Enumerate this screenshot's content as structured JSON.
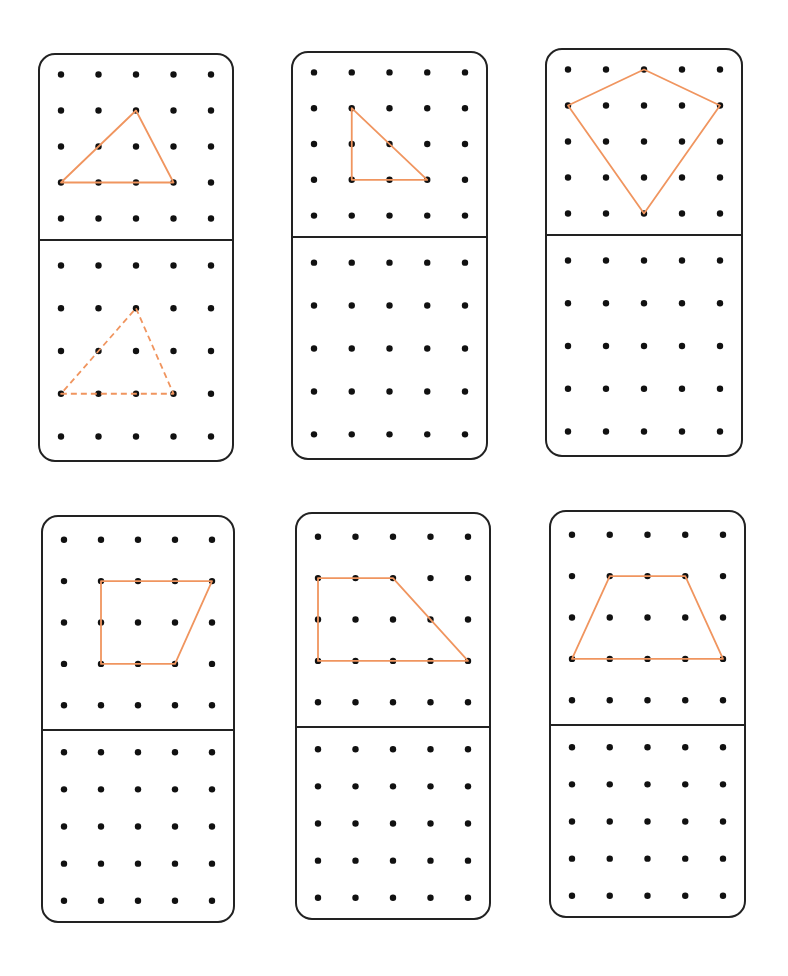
{
  "worksheet": {
    "grid": {
      "rows": 5,
      "cols": 5
    },
    "stroke_color": "#F0955F",
    "dot_color": "#111111",
    "border_color": "#222222",
    "cards": [
      {
        "id": "card-1",
        "box": {
          "x": 38,
          "y": 53,
          "w": 196,
          "h": 409,
          "divider_y": 187
        },
        "top_shape": {
          "type": "triangle",
          "style": "solid",
          "points": [
            [
              2,
              1
            ],
            [
              3,
              3
            ],
            [
              0,
              3
            ]
          ]
        },
        "bottom_shape": {
          "type": "triangle",
          "style": "dashed",
          "points": [
            [
              2,
              1
            ],
            [
              3,
              3
            ],
            [
              0,
              3
            ]
          ]
        }
      },
      {
        "id": "card-2",
        "box": {
          "x": 291,
          "y": 51,
          "w": 197,
          "h": 409,
          "divider_y": 186
        },
        "top_shape": {
          "type": "right-triangle",
          "style": "solid",
          "points": [
            [
              1,
              1
            ],
            [
              3,
              3
            ],
            [
              1,
              3
            ]
          ]
        },
        "bottom_shape": null
      },
      {
        "id": "card-3",
        "box": {
          "x": 545,
          "y": 48,
          "w": 198,
          "h": 409,
          "divider_y": 187
        },
        "top_shape": {
          "type": "kite",
          "style": "solid",
          "points": [
            [
              2,
              0
            ],
            [
              4,
              1
            ],
            [
              2,
              4
            ],
            [
              0,
              1
            ]
          ]
        },
        "bottom_shape": null
      },
      {
        "id": "card-4",
        "box": {
          "x": 41,
          "y": 515,
          "w": 194,
          "h": 408,
          "divider_y": 215
        },
        "top_shape": {
          "type": "right-trapezoid",
          "style": "solid",
          "points": [
            [
              1,
              1
            ],
            [
              4,
              1
            ],
            [
              3,
              3
            ],
            [
              1,
              3
            ]
          ]
        },
        "bottom_shape": null
      },
      {
        "id": "card-5",
        "box": {
          "x": 295,
          "y": 512,
          "w": 196,
          "h": 408,
          "divider_y": 215
        },
        "top_shape": {
          "type": "right-trapezoid",
          "style": "solid",
          "points": [
            [
              0,
              1
            ],
            [
              2,
              1
            ],
            [
              4,
              3
            ],
            [
              0,
              3
            ]
          ]
        },
        "bottom_shape": null
      },
      {
        "id": "card-6",
        "box": {
          "x": 549,
          "y": 510,
          "w": 197,
          "h": 408,
          "divider_y": 215
        },
        "top_shape": {
          "type": "isosceles-trapezoid",
          "style": "solid",
          "points": [
            [
              1,
              1
            ],
            [
              3,
              1
            ],
            [
              4,
              3
            ],
            [
              0,
              3
            ]
          ]
        },
        "bottom_shape": null
      }
    ]
  }
}
